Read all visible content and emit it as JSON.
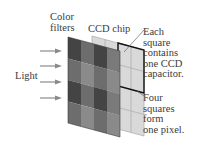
{
  "diagram": {
    "labels": {
      "color_filters": [
        "Color",
        "filters"
      ],
      "ccd_chip": "CCD chip",
      "light": "Light",
      "each_square": [
        "Each",
        "square",
        "contains",
        "one CCD",
        "capacitor."
      ],
      "four_squares": [
        "Four",
        "squares",
        "form",
        "one pixel."
      ]
    },
    "colors": {
      "filter_dark": "#4a4a4a",
      "filter_mid": "#6e6e6e",
      "filter_light": "#8c8c8c",
      "chip_fill": "#d6d6d6",
      "chip_line": "#a8a8a8",
      "pixel_outline": "#111111",
      "arrow": "#8a8a8a"
    }
  }
}
